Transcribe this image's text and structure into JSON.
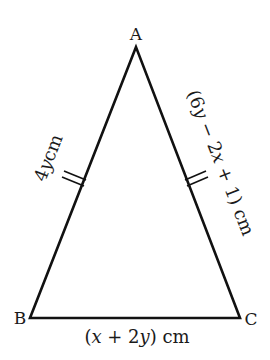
{
  "diagram": {
    "type": "isosceles-triangle",
    "stroke_color": "#111111",
    "vertices": {
      "A": {
        "label": "A",
        "x": 136,
        "y": 47
      },
      "B": {
        "label": "B",
        "x": 30,
        "y": 318
      },
      "C": {
        "label": "C",
        "x": 240,
        "y": 318
      }
    },
    "sides": {
      "AB": {
        "coef": "4",
        "var": "y",
        "unit": "cm",
        "tick_marks": 2
      },
      "AC": {
        "open": "(6",
        "var1": "y",
        "minus": " − 2",
        "var2": "x",
        "rest": " + 1)",
        "unit": " cm",
        "tick_marks": 2
      },
      "BC": {
        "open": "(",
        "var1": "x",
        "plus": " + 2",
        "var2": "y",
        "close": ")",
        "unit": " cm",
        "tick_marks": 0
      }
    }
  }
}
